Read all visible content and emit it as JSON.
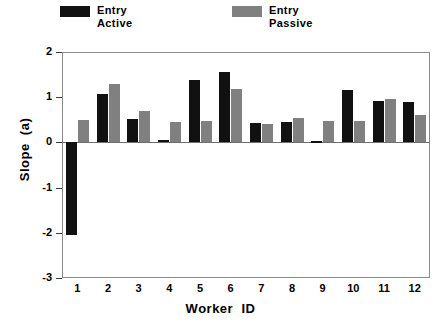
{
  "chart_data": {
    "type": "bar",
    "title": "",
    "xlabel": "Worker  ID",
    "ylabel": "Slope  (a)",
    "categories": [
      "1",
      "2",
      "3",
      "4",
      "5",
      "6",
      "7",
      "8",
      "9",
      "10",
      "11",
      "12"
    ],
    "ylim": [
      -3,
      2
    ],
    "yticks": [
      2,
      1,
      0,
      -1,
      -2,
      -3
    ],
    "ytick_labels": [
      "2",
      "1",
      "0",
      "-1",
      "-2",
      "-3"
    ],
    "grid": false,
    "legend_position": "top",
    "series": [
      {
        "name": "Entry\nActive",
        "label_line1": "Entry",
        "label_line2": "Active",
        "color": "#111111",
        "values": [
          -2.05,
          1.08,
          0.52,
          0.05,
          1.38,
          1.55,
          0.42,
          0.45,
          0.02,
          1.15,
          0.92,
          0.9
        ]
      },
      {
        "name": "Entry\nPassive",
        "label_line1": "Entry",
        "label_line2": "Passive",
        "color": "#808080",
        "values": [
          0.5,
          1.3,
          0.7,
          0.45,
          0.47,
          1.18,
          0.4,
          0.55,
          0.48,
          0.48,
          0.95,
          0.6
        ]
      }
    ]
  }
}
